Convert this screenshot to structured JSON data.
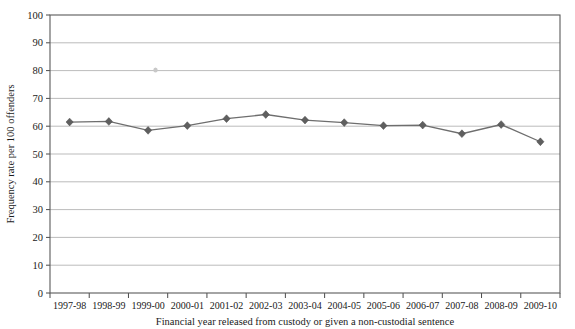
{
  "chart_data": {
    "type": "line",
    "title": "",
    "xlabel": "Financial year released from custody or given a non-custodial sentence",
    "ylabel": "Frequency rate per 100 offenders",
    "categories": [
      "1997-98",
      "1998-99",
      "1999-00",
      "2000-01",
      "2001-02",
      "2002-03",
      "2003-04",
      "2004-05",
      "2005-06",
      "2006-07",
      "2007-08",
      "2008-09",
      "2009-10"
    ],
    "values": [
      61.5,
      61.7,
      58.5,
      60.2,
      62.7,
      64.2,
      62.2,
      61.3,
      60.2,
      60.4,
      57.3,
      60.6,
      54.4
    ],
    "series": [
      {
        "name": "Frequency rate",
        "values": [
          61.5,
          61.7,
          58.5,
          60.2,
          62.7,
          64.2,
          62.2,
          61.3,
          60.2,
          60.4,
          57.3,
          60.6,
          54.4
        ]
      }
    ],
    "ylim": [
      0,
      100
    ],
    "ytick_step": 10,
    "yticks": [
      0,
      10,
      20,
      30,
      40,
      50,
      60,
      70,
      80,
      90,
      100
    ],
    "ytick_labels": [
      "0",
      "10",
      "20",
      "30",
      "40",
      "50",
      "60",
      "70",
      "80",
      "90",
      "100"
    ],
    "grid": true,
    "grid_axis": "y",
    "legend": false,
    "legend_position": "none",
    "marker": "diamond",
    "line_color": "#6e6e6e",
    "marker_color": "#5f5f5f",
    "grid_color": "#a9a9a9",
    "frame_color": "#5a5a5a",
    "background": "#ffffff"
  },
  "plot_geometry": {
    "left": 50,
    "right": 560,
    "top": 15,
    "bottom": 293
  }
}
